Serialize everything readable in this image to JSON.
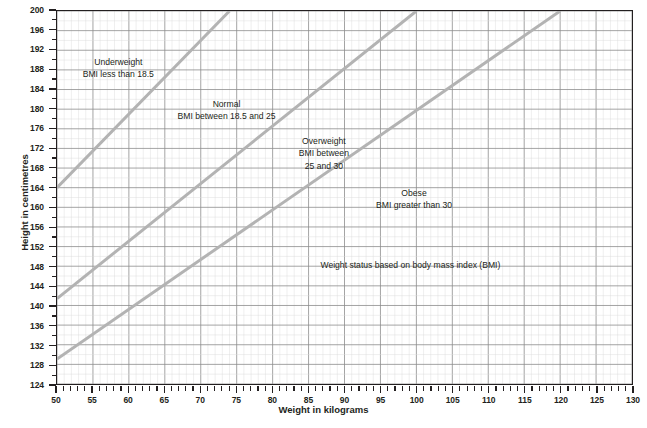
{
  "chart_data": {
    "type": "line",
    "title": "Weight status based on body mass index (BMI)",
    "xlabel": "Weight in kilograms",
    "ylabel": "Height in centimetres",
    "xlim": [
      50,
      130
    ],
    "ylim": [
      124,
      200
    ],
    "x_major_step": 5,
    "x_minor_step": 1,
    "y_major_step": 4,
    "y_minor_step": 2,
    "grid": true,
    "legend": "none",
    "xticks": [
      50,
      55,
      60,
      65,
      70,
      75,
      80,
      85,
      90,
      95,
      100,
      105,
      110,
      115,
      120,
      125,
      130
    ],
    "yticks": [
      124,
      128,
      132,
      136,
      140,
      144,
      148,
      152,
      156,
      160,
      164,
      168,
      172,
      176,
      180,
      184,
      188,
      192,
      196,
      200
    ],
    "line_color": "#b3b3b3",
    "grid_major_color": "#8c8c8c",
    "grid_minor_color": "#dcdcdc",
    "axis_color": "#231f20",
    "series": [
      {
        "name": "BMI 18.5 boundary",
        "x": [
          50,
          74
        ],
        "y": [
          164.0,
          200.0
        ]
      },
      {
        "name": "BMI 25 boundary",
        "x": [
          50,
          100
        ],
        "y": [
          141.4,
          200.0
        ]
      },
      {
        "name": "BMI 30 boundary",
        "x": [
          50,
          120
        ],
        "y": [
          129.1,
          200.0
        ]
      }
    ],
    "annotations": [
      {
        "name": "underweight",
        "title": "Underweight",
        "line1": "BMI less than 18.5",
        "x": 58.5,
        "y": 188.5
      },
      {
        "name": "normal",
        "title": "Normal",
        "line1": "BMI between 18.5 and 25",
        "x": 73.5,
        "y": 180
      },
      {
        "name": "overweight",
        "title": "Overweight",
        "line1": "BMI between",
        "line2": "25 and 30",
        "x": 87,
        "y": 171
      },
      {
        "name": "obese",
        "title": "Obese",
        "line1": "BMI greater than 30",
        "x": 99.5,
        "y": 162
      },
      {
        "name": "caption",
        "title": "Weight status based on body mass index (BMI)",
        "x": 99,
        "y": 148.5
      }
    ]
  }
}
